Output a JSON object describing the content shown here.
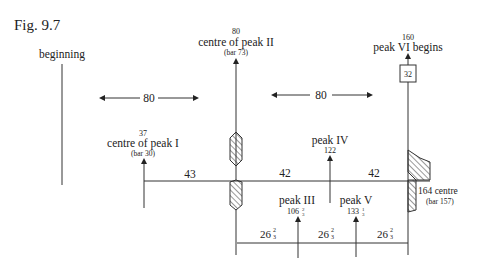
{
  "figure": {
    "label": "Fig. 9.7"
  },
  "markers": {
    "beginning": {
      "label": "beginning"
    },
    "peak1": {
      "value": "37",
      "label": "centre of peak I",
      "bar": "(bar 30)"
    },
    "peak2": {
      "value": "80",
      "label": "centre of peak II",
      "bar": "(bar 73)"
    },
    "peak3": {
      "label": "peak III",
      "value_whole": "106",
      "value_frac_num": "2",
      "value_frac_den": "3"
    },
    "peak4": {
      "label": "peak IV",
      "value": "122"
    },
    "peak5": {
      "label": "peak V",
      "value_whole": "133",
      "value_frac_num": "1",
      "value_frac_den": "3"
    },
    "peak6": {
      "value": "160",
      "label": "peak VI begins",
      "box": "32"
    },
    "centre164": {
      "label": "164 centre",
      "bar": "(bar 157)"
    }
  },
  "spans": {
    "top_left": "80",
    "top_right": "80",
    "mid_left": "43",
    "mid_center": "42",
    "mid_right": "42",
    "bottom": [
      {
        "whole": "26",
        "num": "2",
        "den": "3"
      },
      {
        "whole": "26",
        "num": "2",
        "den": "3"
      },
      {
        "whole": "26",
        "num": "2",
        "den": "3"
      }
    ]
  }
}
